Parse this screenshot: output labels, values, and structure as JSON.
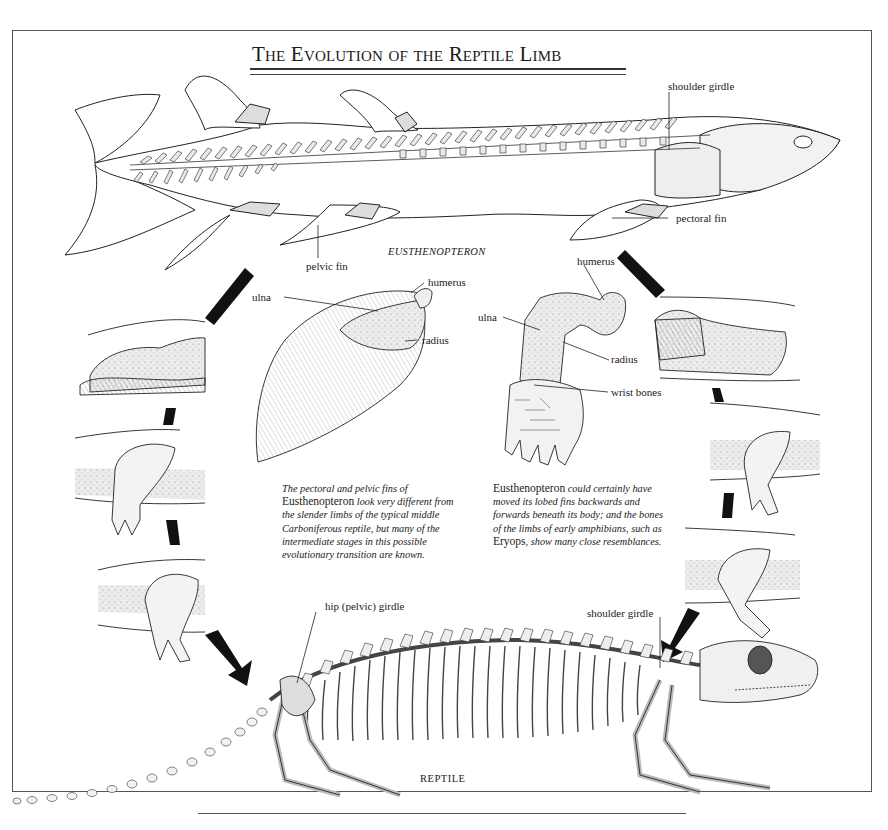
{
  "title": "The Evolution of the Reptile Limb",
  "fish": {
    "name": "EUSTHENOPTERON",
    "labels": {
      "shoulder_girdle": "shoulder girdle",
      "pectoral_fin": "pectoral fin",
      "pelvic_fin": "pelvic fin"
    }
  },
  "fin_detail": {
    "labels": {
      "ulna": "ulna",
      "humerus": "humerus",
      "radius": "radius"
    }
  },
  "limb_detail": {
    "labels": {
      "humerus": "humerus",
      "ulna": "ulna",
      "radius": "radius",
      "wrist_bones": "wrist bones"
    }
  },
  "captions": {
    "left": {
      "pre": "The pectoral and pelvic fins of",
      "genus": "Eusthenopteron",
      "post": "look very different from the slender limbs of the typical middle Carboniferous reptile, but many of the intermediate stages in this possible evolutionary transition are known."
    },
    "right": {
      "genus": "Eusthenopteron",
      "mid": "could certainly have moved its lobed fins backwards and forwards beneath its body; and the bones of the limbs of early amphibians, such as",
      "genus2": "Eryops",
      "post": ", show many close resemblances."
    }
  },
  "reptile": {
    "name": "REPTILE",
    "labels": {
      "hip_girdle": "hip (pelvic) girdle",
      "shoulder_girdle": "shoulder girdle"
    }
  },
  "transition_panels": {
    "left": [
      "pelvic fin stage 1",
      "pelvic limb stage 2",
      "pelvic limb stage 3"
    ],
    "right": [
      "pectoral fin stage 1",
      "pectoral limb stage 2",
      "pectoral limb stage 3"
    ]
  }
}
